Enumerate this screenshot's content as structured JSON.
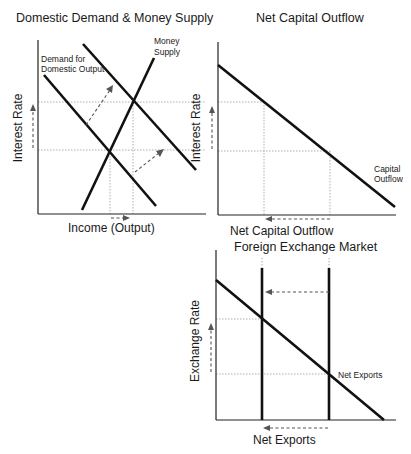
{
  "panels": {
    "domestic": {
      "title": "Domestic Demand & Money Supply",
      "ylabel": "Interest Rate",
      "xlabel": "Income (Output)",
      "curves": {
        "demand_label_1": "Demand for",
        "demand_label_2": "Domestic Output",
        "money_label_1": "Money",
        "money_label_2": "Supply"
      }
    },
    "capital": {
      "title": "Net Capital Outflow",
      "ylabel": "Interest Rate",
      "xlabel": "Net Capital Outflow",
      "curves": {
        "capital_label_1": "Capital",
        "capital_label_2": "Outflow"
      }
    },
    "forex": {
      "title": "Foreign Exchange Market",
      "ylabel": "Exchange Rate",
      "xlabel": "Net Exports",
      "curves": {
        "net_exports_label": "Net Exports"
      }
    }
  },
  "colors": {
    "curve": "#111111",
    "guide": "#9a9a9a",
    "shift_arrow": "#555555"
  }
}
